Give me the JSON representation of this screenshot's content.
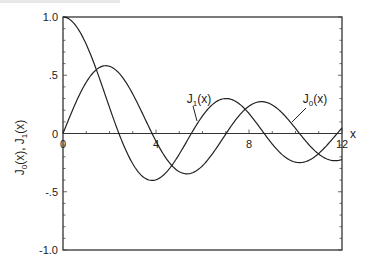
{
  "chart_data": {
    "type": "line",
    "title": "",
    "xlabel": "x",
    "ylabel": "J0(x), J1(x)",
    "xlim": [
      0,
      12
    ],
    "ylim": [
      -1.0,
      1.0
    ],
    "grid": false,
    "legend": "inline labels",
    "x_ticks": [
      "0",
      "4",
      "8",
      "12"
    ],
    "y_ticks": [
      "1.0",
      ".5",
      "0",
      "-.5",
      "-1.0"
    ],
    "series": [
      {
        "name": "J0(x)",
        "label_sub": "0",
        "x": [
          0,
          0.5,
          1,
          1.5,
          2,
          2.5,
          3,
          3.5,
          4,
          4.5,
          5,
          5.5,
          6,
          6.5,
          7,
          7.5,
          8,
          8.5,
          9,
          9.5,
          10,
          10.5,
          11,
          11.5,
          12
        ],
        "values": [
          1.0,
          0.938,
          0.765,
          0.512,
          0.224,
          -0.048,
          -0.26,
          -0.38,
          -0.397,
          -0.321,
          -0.178,
          -0.007,
          0.151,
          0.26,
          0.3,
          0.266,
          0.172,
          0.042,
          -0.09,
          -0.194,
          -0.246,
          -0.237,
          -0.171,
          -0.068,
          0.048
        ]
      },
      {
        "name": "J1(x)",
        "label_sub": "1",
        "x": [
          0,
          0.5,
          1,
          1.5,
          2,
          2.5,
          3,
          3.5,
          4,
          4.5,
          5,
          5.5,
          6,
          6.5,
          7,
          7.5,
          8,
          8.5,
          9,
          9.5,
          10,
          10.5,
          11,
          11.5,
          12
        ],
        "values": [
          0.0,
          0.242,
          0.44,
          0.558,
          0.577,
          0.497,
          0.339,
          0.137,
          -0.066,
          -0.231,
          -0.328,
          -0.341,
          -0.277,
          -0.154,
          -0.005,
          0.135,
          0.235,
          0.273,
          0.245,
          0.161,
          0.043,
          -0.079,
          -0.177,
          -0.228,
          -0.223
        ]
      }
    ]
  },
  "labels": {
    "x_axis": "x",
    "y_axis_parts": [
      "J",
      "0",
      "(x), J",
      "1",
      "(x)"
    ],
    "j0": {
      "main": "J",
      "sub": "0",
      "tail": "(x)"
    },
    "j1": {
      "main": "J",
      "sub": "1",
      "tail": "(x)"
    }
  }
}
